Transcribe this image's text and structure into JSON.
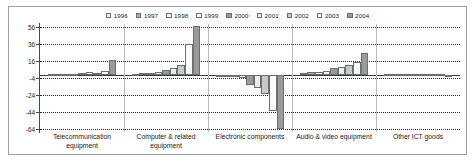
{
  "chart_data": {
    "type": "bar",
    "title": "",
    "subtitle": "",
    "xlabel": "",
    "ylabel": "",
    "grid": true,
    "legend_position": "top-center",
    "ylim": [
      -64,
      56
    ],
    "yticks": [
      56,
      36,
      16,
      -4,
      -24,
      -44,
      -64
    ],
    "ytick_labels": [
      "56",
      "36",
      "16",
      "-4",
      "-24",
      "-44",
      "-64"
    ],
    "categories": [
      "Telecommunication equipment",
      "Computer & related equipment",
      "Electronic components",
      "Audio & video equipment",
      "Other ICT goods"
    ],
    "series": [
      {
        "name": "1996",
        "color": "#f2f2f2",
        "values": [
          0.4,
          0.6,
          -0.5,
          2.2,
          0.2
        ]
      },
      {
        "name": "1997",
        "color": "#a8a8a8",
        "values": [
          0.5,
          1.4,
          -1.0,
          2.6,
          0.2
        ]
      },
      {
        "name": "1998",
        "color": "#f7f7f7",
        "values": [
          0.6,
          1.8,
          -2.2,
          3.2,
          0.3
        ]
      },
      {
        "name": "1999",
        "color": "#ffffff",
        "values": [
          0.8,
          2.6,
          -4.2,
          4.6,
          0.3
        ]
      },
      {
        "name": "2000",
        "color": "#9a9a9a",
        "values": [
          1.6,
          5.6,
          -12.0,
          7.6,
          0.4
        ]
      },
      {
        "name": "2001",
        "color": "#ededed",
        "values": [
          2.6,
          7.4,
          -16.0,
          9.2,
          0.4
        ]
      },
      {
        "name": "2002",
        "color": "#c9c9c9",
        "values": [
          2.4,
          11.8,
          -23.0,
          11.8,
          0.5
        ]
      },
      {
        "name": "2003",
        "color": "#fbfbfb",
        "values": [
          4.6,
          35.8,
          -43.0,
          15.4,
          0.6
        ]
      },
      {
        "name": "2004",
        "color": "#9a9a9a",
        "values": [
          17.6,
          57.0,
          -63.5,
          25.6,
          -2.0
        ]
      }
    ]
  },
  "legend": {
    "items": [
      {
        "label": "1996"
      },
      {
        "label": "1997"
      },
      {
        "label": "1998"
      },
      {
        "label": "1999"
      },
      {
        "label": "2000"
      },
      {
        "label": "2001"
      },
      {
        "label": "2002"
      },
      {
        "label": "2003"
      },
      {
        "label": "2004"
      }
    ]
  },
  "axis": {
    "y_labels": [
      "56",
      "36",
      "16",
      "-4",
      "-24",
      "-44",
      "-64"
    ],
    "x_labels": [
      {
        "line1": "Telecommunication",
        "line2": "equipment"
      },
      {
        "line1": "Computer & related",
        "line2": "equipment"
      },
      {
        "line1": "Electronic components",
        "line2": ""
      },
      {
        "line1": "Audio & video equipment",
        "line2": ""
      },
      {
        "line1": "Other ICT goods",
        "line2": ""
      }
    ]
  }
}
